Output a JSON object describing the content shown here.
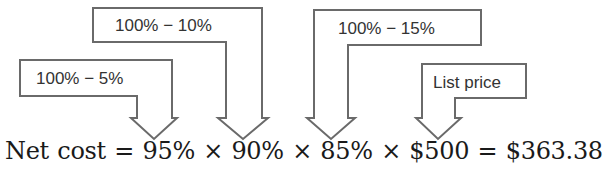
{
  "diagram": {
    "callouts": [
      {
        "id": "discount-5",
        "label": "100% − 5%"
      },
      {
        "id": "discount-10",
        "label": "100% − 10%"
      },
      {
        "id": "discount-15",
        "label": "100% − 15%"
      },
      {
        "id": "list-price",
        "label": "List price"
      }
    ],
    "equation": {
      "lhs": "Net cost",
      "eq1": "=",
      "term1": "95%",
      "times1": "×",
      "term2": "90%",
      "times2": "×",
      "term3": "85%",
      "times3": "×",
      "term4": "$500",
      "eq2": "=",
      "result": "$363.38"
    },
    "colors": {
      "stroke": "#666666",
      "text": "#1a1a1a"
    }
  }
}
